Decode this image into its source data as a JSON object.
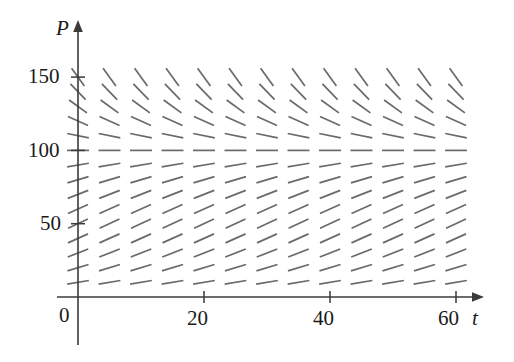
{
  "figure": {
    "kind": "slope-field",
    "background_color": "#ffffff",
    "axis_color": "#3a3a3a",
    "segment_color": "#6a6a6a"
  },
  "axes": {
    "x_axis_label": "t",
    "y_axis_label": "P",
    "x_tick_labels": [
      "0",
      "20",
      "40",
      "60"
    ],
    "y_tick_labels": [
      "50",
      "100",
      "150"
    ],
    "origin_label": "0"
  },
  "chart_data": {
    "type": "line",
    "title": "",
    "subtitle": "",
    "xlabel": "t",
    "ylabel": "P",
    "xlim": [
      0,
      63
    ],
    "ylim": [
      0,
      165
    ],
    "xticks": [
      0,
      20,
      40,
      60
    ],
    "yticks": [
      0,
      50,
      100,
      150
    ],
    "xtick_labels": [
      "0",
      "20",
      "40",
      "60"
    ],
    "ytick_labels": [
      "0",
      "50",
      "100",
      "150"
    ],
    "grid": false,
    "legend": "none",
    "annotations": [],
    "slope_field": {
      "equation_form": "dP/dt = k*P*(1 - P/100)",
      "carrying_capacity": 100,
      "growth_rate_k": 0.08,
      "equilibrium_levels": [
        0,
        100
      ],
      "t_values": [
        0,
        5,
        10,
        15,
        20,
        25,
        30,
        35,
        40,
        45,
        50,
        55,
        60
      ],
      "P_values": [
        10,
        20,
        30,
        40,
        50,
        60,
        70,
        80,
        90,
        100,
        110,
        120,
        130,
        140,
        150
      ],
      "segment_half_length_px": 11,
      "slopes_by_P": [
        {
          "P": 10,
          "dPdt": 0.72
        },
        {
          "P": 20,
          "dPdt": 1.28
        },
        {
          "P": 30,
          "dPdt": 1.68
        },
        {
          "P": 40,
          "dPdt": 1.92
        },
        {
          "P": 50,
          "dPdt": 2.0
        },
        {
          "P": 60,
          "dPdt": 1.92
        },
        {
          "P": 70,
          "dPdt": 1.68
        },
        {
          "P": 80,
          "dPdt": 1.28
        },
        {
          "P": 90,
          "dPdt": 0.72
        },
        {
          "P": 100,
          "dPdt": 0.0
        },
        {
          "P": 110,
          "dPdt": -0.88
        },
        {
          "P": 120,
          "dPdt": -1.92
        },
        {
          "P": 130,
          "dPdt": -3.12
        },
        {
          "P": 140,
          "dPdt": -4.48
        },
        {
          "P": 150,
          "dPdt": -6.0
        }
      ]
    }
  },
  "geometry": {
    "origin_x_px": 78,
    "origin_y_px": 297,
    "px_per_t_unit": 6.3,
    "px_per_P_unit": 1.466,
    "y_axis_top_px": 22,
    "x_axis_right_px": 484,
    "y_axis_bottom_px": 345
  }
}
